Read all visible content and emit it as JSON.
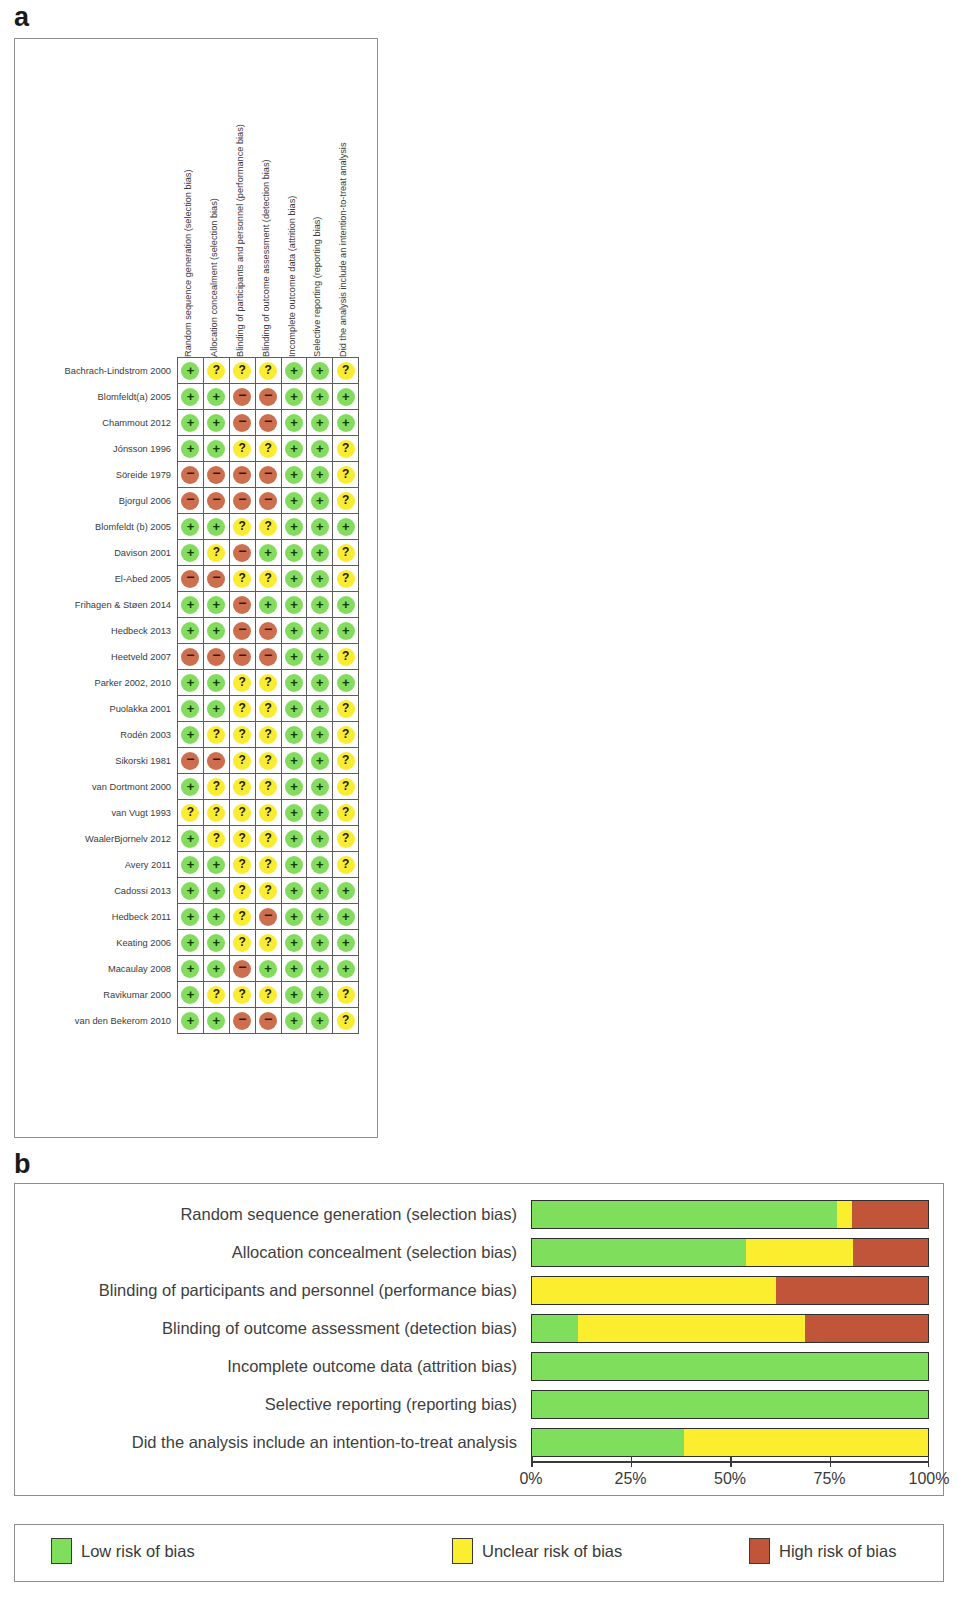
{
  "panels": {
    "a_letter": "a",
    "b_letter": "b"
  },
  "colors": {
    "low": "#7fde5c",
    "unclear": "#fbee2e",
    "high": "#c0553a",
    "symbol_low": "#84dc5f",
    "symbol_unclear": "#faec33",
    "symbol_high": "#cd6f4e",
    "frame": "#8d8d8d",
    "grid": "#5d5d5d"
  },
  "domains": [
    "Random sequence generation (selection bias)",
    "Allocation concealment (selection bias)",
    "Blinding of participants and personnel (performance bias)",
    "Blinding of outcome assessment (detection bias)",
    "Incomplete outcome data (attrition bias)",
    "Selective reporting (reporting bias)",
    "Did the analysis include an intention-to-treat analysis"
  ],
  "symbols": {
    "low": "+",
    "unclear": "?",
    "high": "−"
  },
  "risk_matrix": {
    "studies": [
      {
        "label": "Bachrach-Lindstrom 2000",
        "judgements": [
          "low",
          "unclear",
          "unclear",
          "unclear",
          "low",
          "low",
          "unclear"
        ]
      },
      {
        "label": "Blomfeldt(a)  2005",
        "judgements": [
          "low",
          "low",
          "high",
          "high",
          "low",
          "low",
          "low"
        ]
      },
      {
        "label": "Chammout 2012",
        "judgements": [
          "low",
          "low",
          "high",
          "high",
          "low",
          "low",
          "low"
        ]
      },
      {
        "label": "Jónsson 1996",
        "judgements": [
          "low",
          "low",
          "unclear",
          "unclear",
          "low",
          "low",
          "unclear"
        ]
      },
      {
        "label": "Söreide 1979",
        "judgements": [
          "high",
          "high",
          "high",
          "high",
          "low",
          "low",
          "unclear"
        ]
      },
      {
        "label": "Bjorgul 2006",
        "judgements": [
          "high",
          "high",
          "high",
          "high",
          "low",
          "low",
          "unclear"
        ]
      },
      {
        "label": "Blomfeldt (b) 2005",
        "judgements": [
          "low",
          "low",
          "unclear",
          "unclear",
          "low",
          "low",
          "low"
        ]
      },
      {
        "label": "Davison 2001",
        "judgements": [
          "low",
          "unclear",
          "high",
          "low",
          "low",
          "low",
          "unclear"
        ]
      },
      {
        "label": "El-Abed 2005",
        "judgements": [
          "high",
          "high",
          "unclear",
          "unclear",
          "low",
          "low",
          "unclear"
        ]
      },
      {
        "label": "Frihagen  & Støen 2014",
        "judgements": [
          "low",
          "low",
          "high",
          "low",
          "low",
          "low",
          "low"
        ]
      },
      {
        "label": "Hedbeck 2013",
        "judgements": [
          "low",
          "low",
          "high",
          "high",
          "low",
          "low",
          "low"
        ]
      },
      {
        "label": "Heetveld 2007",
        "judgements": [
          "high",
          "high",
          "high",
          "high",
          "low",
          "low",
          "unclear"
        ]
      },
      {
        "label": "Parker 2002, 2010",
        "judgements": [
          "low",
          "low",
          "unclear",
          "unclear",
          "low",
          "low",
          "low"
        ]
      },
      {
        "label": "Puolakka 2001",
        "judgements": [
          "low",
          "low",
          "unclear",
          "unclear",
          "low",
          "low",
          "unclear"
        ]
      },
      {
        "label": "Rodén 2003",
        "judgements": [
          "low",
          "unclear",
          "unclear",
          "unclear",
          "low",
          "low",
          "unclear"
        ]
      },
      {
        "label": "Sikorski 1981",
        "judgements": [
          "high",
          "high",
          "unclear",
          "unclear",
          "low",
          "low",
          "unclear"
        ]
      },
      {
        "label": "van Dortmont 2000",
        "judgements": [
          "low",
          "unclear",
          "unclear",
          "unclear",
          "low",
          "low",
          "unclear"
        ]
      },
      {
        "label": "van Vugt 1993",
        "judgements": [
          "unclear",
          "unclear",
          "unclear",
          "unclear",
          "low",
          "low",
          "unclear"
        ]
      },
      {
        "label": "WaalerBjornelv 2012",
        "judgements": [
          "low",
          "unclear",
          "unclear",
          "unclear",
          "low",
          "low",
          "unclear"
        ]
      },
      {
        "label": "Avery 2011",
        "judgements": [
          "low",
          "low",
          "unclear",
          "unclear",
          "low",
          "low",
          "unclear"
        ]
      },
      {
        "label": "Cadossi 2013",
        "judgements": [
          "low",
          "low",
          "unclear",
          "unclear",
          "low",
          "low",
          "low"
        ]
      },
      {
        "label": "Hedbeck 2011",
        "judgements": [
          "low",
          "low",
          "unclear",
          "high",
          "low",
          "low",
          "low"
        ]
      },
      {
        "label": "Keating 2006",
        "judgements": [
          "low",
          "low",
          "unclear",
          "unclear",
          "low",
          "low",
          "low"
        ]
      },
      {
        "label": "Macaulay 2008",
        "judgements": [
          "low",
          "low",
          "high",
          "low",
          "low",
          "low",
          "low"
        ]
      },
      {
        "label": "Ravikumar 2000",
        "judgements": [
          "low",
          "unclear",
          "unclear",
          "unclear",
          "low",
          "low",
          "unclear"
        ]
      },
      {
        "label": "van den Bekerom 2010",
        "judgements": [
          "low",
          "low",
          "high",
          "high",
          "low",
          "low",
          "unclear"
        ]
      }
    ]
  },
  "chart_data": {
    "type": "bar",
    "subtype": "stacked-horizontal-percentage",
    "title": "",
    "xlabel": "",
    "ylabel": "",
    "xlim": [
      0,
      100
    ],
    "grid": false,
    "legend_position": "bottom",
    "tick_labels": [
      "0%",
      "25%",
      "50%",
      "75%",
      "100%"
    ],
    "tick_values": [
      0,
      25,
      50,
      75,
      100
    ],
    "categories": [
      "Random sequence generation (selection bias)",
      "Allocation concealment (selection bias)",
      "Blinding of participants and personnel (performance bias)",
      "Blinding of outcome assessment (detection bias)",
      "Incomplete outcome data (attrition bias)",
      "Selective reporting (reporting bias)",
      "Did the analysis include an intention-to-treat analysis"
    ],
    "series": [
      {
        "name": "Low risk of bias",
        "color": "#7fde5c",
        "values": [
          77,
          54,
          0,
          11.5,
          100,
          100,
          38.5
        ]
      },
      {
        "name": "Unclear risk of bias",
        "color": "#fbee2e",
        "values": [
          3.8,
          27,
          61.5,
          57.5,
          0,
          0,
          61.5
        ]
      },
      {
        "name": "High risk of bias",
        "color": "#c0553a",
        "values": [
          19.2,
          19,
          38.5,
          31,
          0,
          0,
          0
        ]
      }
    ]
  },
  "legend": {
    "items": [
      {
        "label": "Low risk of bias",
        "key": "low"
      },
      {
        "label": "Unclear risk of bias",
        "key": "unclear"
      },
      {
        "label": "High risk of bias",
        "key": "high"
      }
    ]
  }
}
